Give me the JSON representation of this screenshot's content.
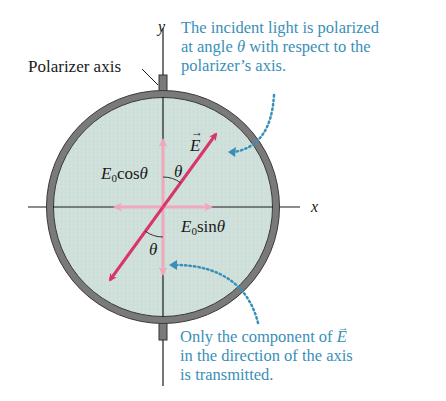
{
  "figure": {
    "title_partial": "",
    "labels": {
      "polarizer_axis": "Polarizer axis",
      "y_axis": "y",
      "x_axis": "x",
      "e_vector": "E",
      "e_vector_arrow": "→",
      "component_cos": {
        "base": "E",
        "sub": "0",
        "func": "cos",
        "arg": "θ"
      },
      "component_sin": {
        "base": "E",
        "sub": "0",
        "func": "sin",
        "arg": "θ"
      },
      "theta_top": "θ",
      "theta_bottom": "θ"
    },
    "annotations": {
      "top": {
        "line1": "The incident light is polarized",
        "line2_pre": "at angle ",
        "line2_theta": "θ",
        "line2_post": " with respect to the",
        "line3": "polarizer’s axis."
      },
      "bottom": {
        "line1_pre": "Only the component of ",
        "line1_vec": "E",
        "line2": "in the direction of the axis",
        "line3": "is transmitted."
      }
    },
    "colors": {
      "disk_fill": "#cfe0db",
      "ring": "#7a7a7a",
      "e_vector": "#d8366a",
      "components": "#f0a8bc",
      "annotation_text": "#3a8fb8",
      "dotted_leader": "#3a8fb8",
      "axis_line": "#1a1a1a"
    }
  }
}
